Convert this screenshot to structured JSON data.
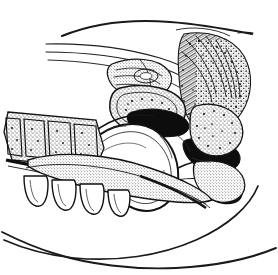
{
  "plate": {
    "background_color": "#ffffff",
    "ink_color": "#1a1a1a",
    "width": 278,
    "height": 275
  },
  "caption": {
    "prefix_large": "F",
    "prefix_small": "IG",
    "separator": ". ",
    "number": "24",
    "terminator": ".",
    "full_text": "FIG. 24."
  },
  "figure": {
    "title": "Fig. 24.",
    "medium": "engraving",
    "regions": [
      {
        "name": "cranial-vault-contour",
        "description": "long sweeping upper contour line running from upper left to upper right"
      },
      {
        "name": "nasal-passage-lines",
        "description": "three thin parallel curves converging toward the right"
      },
      {
        "name": "hatched-occipital-mass",
        "description": "dense crosshatched and stippled mass at upper right"
      },
      {
        "name": "nasal-turbinate-detail",
        "description": "fine stippled oval detail in the mid upper area"
      },
      {
        "name": "pharyngeal-cavity",
        "description": "solid black cavity shapes in the central right area"
      },
      {
        "name": "tongue-outline",
        "description": "large lobed outline occupying the centre of the plate"
      },
      {
        "name": "vertebral-bodies",
        "description": "stippled rectangular blocks forming a column at mid left"
      },
      {
        "name": "mandible-teeth",
        "description": "finger-like projections along the lower left edge"
      },
      {
        "name": "neck-contour-upper",
        "description": "long sweeping curve across the lower half"
      },
      {
        "name": "neck-contour-lower",
        "description": "second long sweeping curve beneath the first"
      }
    ]
  }
}
